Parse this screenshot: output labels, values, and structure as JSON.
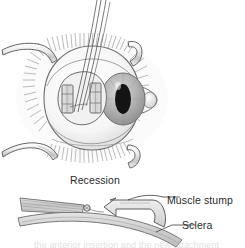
{
  "figure": {
    "title": "Recession",
    "kind": "medical-illustration",
    "background_color": "#ffffff",
    "ink_color": "#3a3a3a",
    "labels": {
      "recession": "Recession",
      "muscle_stump": "Muscle stump",
      "sclera": "Sclera",
      "cutoff_caption": "the anterior insertion and the new attachment"
    },
    "upper_panel": {
      "name": "anterior-view-of-eye",
      "parts": [
        "upper-lid-retractor",
        "lower-lid-retractor",
        "upper-lid-hook",
        "lower-lid-hook",
        "eyelashes",
        "sclera-globe",
        "iris",
        "pupil",
        "caruncle",
        "conjunctival-opening",
        "muscle-pad-left",
        "muscle-pad-right",
        "suture-threads"
      ],
      "colors": {
        "instrument_fill": "#f2f2f2",
        "sclera_fill": "#f7f7f7",
        "iris_fill": "#b9b9b9",
        "pupil_fill": "#141414",
        "muscle_pad_fill": "#d8d8d8",
        "conjunctiva_fill": "#efefef"
      }
    },
    "lower_panel": {
      "name": "cross-section-of-recession",
      "parts": [
        "rectus-muscle",
        "suture-knot",
        "muscle-stump",
        "sclera-band",
        "leader-line-muscle-stump",
        "leader-line-sclera"
      ],
      "colors": {
        "muscle_fill": "#cccccc",
        "sclera_band_fill": "#d2d2d2",
        "stump_fill": "#e0e0e0"
      }
    }
  }
}
